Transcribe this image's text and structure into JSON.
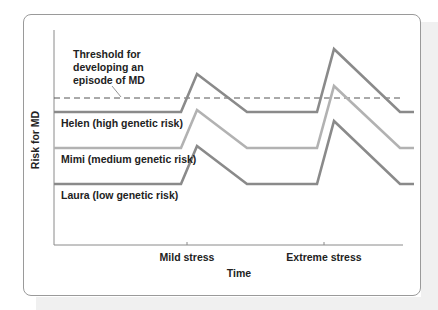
{
  "chart_data": {
    "type": "line",
    "title": "",
    "xlabel": "Time",
    "ylabel": "Risk for MD",
    "x_ticks": [
      "Mild stress",
      "Extreme stress"
    ],
    "grid": false,
    "legend": "inline labels",
    "threshold": {
      "label_lines": [
        "Threshold for",
        "developing an",
        "episode of MD"
      ],
      "y": 98,
      "style": "dashed"
    },
    "x": [
      54,
      181,
      197,
      247,
      317,
      334,
      400,
      414
    ],
    "series": [
      {
        "name": "Helen (high genetic risk)",
        "color": "#8a8a8a",
        "values": [
          112,
          112,
          74,
          112,
          112,
          49,
          112,
          112
        ]
      },
      {
        "name": "Mimi (medium genetic risk)",
        "color": "#b2b2b2",
        "values": [
          148,
          148,
          110,
          148,
          148,
          86,
          148,
          148
        ]
      },
      {
        "name": "Laura (low genetic risk)",
        "color": "#8a8a8a",
        "values": [
          184,
          184,
          146,
          184,
          184,
          121,
          184,
          184
        ]
      }
    ]
  }
}
